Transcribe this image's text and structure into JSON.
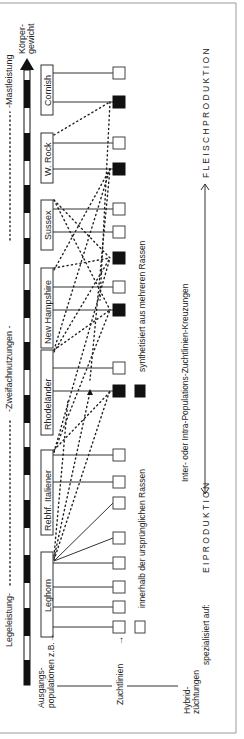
{
  "diagram": {
    "axis": {
      "label_top": "Körper-",
      "label_bottom": "gewicht",
      "scale_left": "Legeleistung-",
      "scale_mid": "-Zweifachnutzungen -",
      "scale_right": "-Mastleistung"
    },
    "rows": {
      "ausgangs": "Ausgangs-",
      "populationen": "populationen z.B.→",
      "zuchtlinien": "Zuchtlinien",
      "zuchtlinien_arrow": "→",
      "hybrid1": "Hybrid-",
      "hybrid2": "züchtungen"
    },
    "breeds": [
      {
        "name": "Leghorn"
      },
      {
        "name": "Rebhf. Italiener"
      },
      {
        "name": "Rhodeländer"
      },
      {
        "name": "New Hampshire"
      },
      {
        "name": "Sussex"
      },
      {
        "name": "W. Rock"
      },
      {
        "name": "Cornish"
      }
    ],
    "legend": {
      "white": "innerhalb der ursprünglichen Rassen",
      "black": "synthetisiert aus mehreren Rassen"
    },
    "crossing_label": "Inter- oder Intra-Populations-Zuchtlinien-Kreuzungen",
    "specialized": "spezialisiert auf:",
    "egg": "E I P R O D U K T I O N",
    "meat": "F L E I S C H P R O D U K T I O N",
    "colors": {
      "black": "#111111",
      "frame": "#9a9a9a",
      "line": "#333333"
    }
  }
}
